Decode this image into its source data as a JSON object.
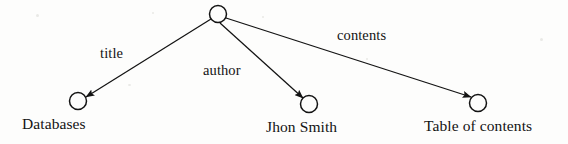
{
  "figure": {
    "background_color": "#fdfdfc",
    "stroke_color": "#131313",
    "text_color": "#131313"
  },
  "graph": {
    "type": "directed-tree",
    "nodes": [
      {
        "id": "root",
        "label": "",
        "cx": 218,
        "cy": 14,
        "r": 8.5,
        "role": "root-resource"
      },
      {
        "id": "databases",
        "label": "Databases",
        "cx": 78,
        "cy": 101,
        "r": 8.5,
        "role": "leaf-literal",
        "label_x": 22,
        "label_y": 116
      },
      {
        "id": "jhon-smith",
        "label": "Jhon Smith",
        "cx": 309,
        "cy": 104,
        "r": 8.5,
        "role": "leaf-literal",
        "label_x": 266,
        "label_y": 119
      },
      {
        "id": "table-of-contents",
        "label": "Table of contents",
        "cx": 478,
        "cy": 103,
        "r": 8.5,
        "role": "leaf-literal",
        "label_x": 424,
        "label_y": 118
      }
    ],
    "edges": [
      {
        "id": "edge-title",
        "label": "title",
        "from": "root",
        "to": "databases",
        "x1": 211,
        "y1": 19,
        "x2": 86,
        "y2": 97,
        "label_x": 100,
        "label_y": 46
      },
      {
        "id": "edge-author",
        "label": "author",
        "from": "root",
        "to": "jhon-smith",
        "x1": 220,
        "y1": 23,
        "x2": 303,
        "y2": 98,
        "label_x": 203,
        "label_y": 63
      },
      {
        "id": "edge-contents",
        "label": "contents",
        "from": "root",
        "to": "table-of-contents",
        "x1": 226,
        "y1": 18,
        "x2": 471,
        "y2": 97,
        "label_x": 337,
        "label_y": 28
      }
    ]
  }
}
